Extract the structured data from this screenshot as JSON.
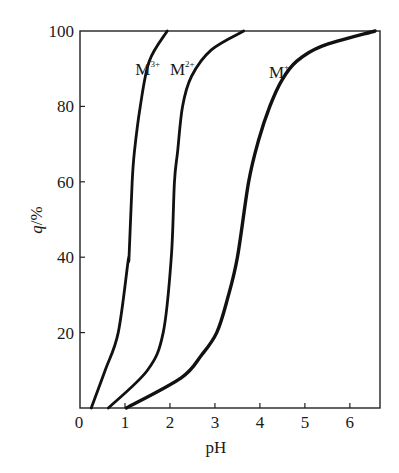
{
  "chart_data": {
    "type": "line",
    "title": "",
    "xlabel": "pH",
    "ylabel": "q/%",
    "ylabel_parts": {
      "var": "q",
      "unit": "/%"
    },
    "xlim": [
      0,
      6.67
    ],
    "ylim": [
      0,
      100
    ],
    "xticks": [
      0,
      1,
      2,
      3,
      4,
      5,
      6
    ],
    "yticks": [
      20,
      40,
      60,
      80,
      100
    ],
    "grid": false,
    "legend": "inline labels near curve tops",
    "series": [
      {
        "name": "M3+",
        "label_base": "M",
        "label_sup": "3+",
        "label_pos": [
          1.23,
          90
        ],
        "x": [
          0.25,
          0.56,
          0.85,
          1.07,
          1.09,
          1.16,
          1.21,
          1.34,
          1.54,
          1.94
        ],
        "y": [
          0,
          10,
          20,
          39,
          40,
          60,
          68,
          80,
          92,
          100
        ]
      },
      {
        "name": "M2+",
        "label_base": "M",
        "label_sup": "2+",
        "label_pos": [
          2.0,
          90
        ],
        "x": [
          0.63,
          1.5,
          1.85,
          2.03,
          2.1,
          2.17,
          2.28,
          2.48,
          2.92,
          3.64
        ],
        "y": [
          0,
          10,
          20,
          40,
          60,
          68,
          80,
          88,
          95,
          100
        ]
      },
      {
        "name": "M+",
        "label_base": "M",
        "label_sup": "+",
        "label_pos": [
          4.2,
          89
        ],
        "x": [
          1.03,
          2.25,
          2.7,
          3.04,
          3.28,
          3.5,
          3.75,
          3.97,
          4.22,
          4.49,
          4.82,
          5.38,
          6.56
        ],
        "y": [
          0,
          8,
          14,
          20,
          29,
          40,
          60,
          71,
          80,
          87,
          92,
          96,
          100
        ]
      }
    ],
    "colors": {
      "line": "#111111",
      "axis": "#222222",
      "background": "#ffffff"
    }
  }
}
